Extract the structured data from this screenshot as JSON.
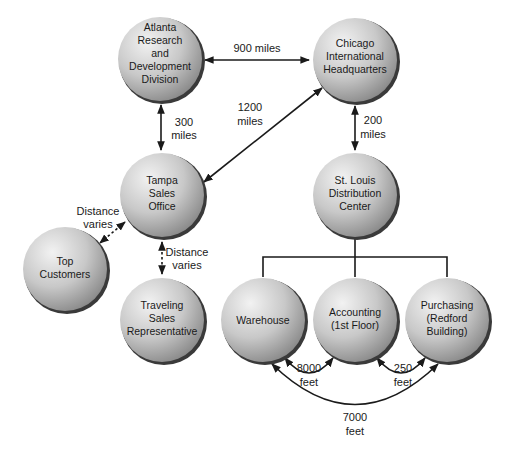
{
  "colors": {
    "node_light": "#eeeeee",
    "node_dark": "#8e8e8e",
    "node_shadow": "#3a3a3a",
    "line": "#1a1a1a",
    "text": "#1a1a1a"
  },
  "nodes": {
    "atlanta": {
      "lines": [
        "Atlanta",
        "Research",
        "and",
        "Development",
        "Division"
      ]
    },
    "chicago": {
      "lines": [
        "Chicago",
        "International",
        "Headquarters"
      ]
    },
    "tampa": {
      "lines": [
        "Tampa",
        "Sales",
        "Office"
      ]
    },
    "stlouis": {
      "lines": [
        "St. Louis",
        "Distribution",
        "Center"
      ]
    },
    "customers": {
      "lines": [
        "Top",
        "Customers"
      ]
    },
    "traveling": {
      "lines": [
        "Traveling",
        "Sales",
        "Representative"
      ]
    },
    "warehouse": {
      "lines": [
        "Warehouse"
      ]
    },
    "accounting": {
      "lines": [
        "Accounting",
        "(1st Floor)"
      ]
    },
    "purchasing": {
      "lines": [
        "Purchasing",
        "(Redford",
        "Building)"
      ]
    }
  },
  "edges": {
    "atlanta_chicago": {
      "lines": [
        "900 miles"
      ]
    },
    "atlanta_tampa": {
      "lines": [
        "300",
        "miles"
      ]
    },
    "tampa_chicago": {
      "lines": [
        "1200",
        "miles"
      ]
    },
    "chicago_stlouis": {
      "lines": [
        "200",
        "miles"
      ]
    },
    "tampa_customers": {
      "lines": [
        "Distance",
        "varies"
      ]
    },
    "tampa_traveling": {
      "lines": [
        "Distance",
        "varies"
      ]
    },
    "warehouse_accounting": {
      "lines": [
        "8000",
        "feet"
      ]
    },
    "accounting_purchasing": {
      "lines": [
        "250",
        "feet"
      ]
    },
    "warehouse_purchasing": {
      "lines": [
        "7000",
        "feet"
      ]
    }
  }
}
